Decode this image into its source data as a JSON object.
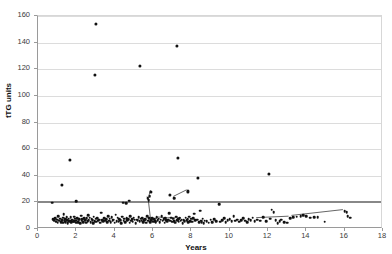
{
  "chart": {
    "title": "",
    "y_axis_title": "tTG units",
    "x_axis_title": "Years"
  },
  "chart_data": {
    "type": "scatter",
    "title": "",
    "xlabel": "Years",
    "ylabel": "tTG units",
    "xlim": [
      0,
      18
    ],
    "ylim": [
      0,
      160
    ],
    "xticks": [
      0,
      2,
      4,
      6,
      8,
      10,
      12,
      14,
      16,
      18
    ],
    "yticks": [
      0,
      20,
      40,
      60,
      80,
      100,
      120,
      140,
      160
    ],
    "grid": "horizontal",
    "legend": "none",
    "marker": "filled-circle",
    "marker_color": "#111111",
    "reference_line": {
      "orientation": "horizontal",
      "value": 20.5,
      "color": "#888888",
      "label": ""
    },
    "points": [
      [
        0.75,
        19.8
      ],
      [
        0.8,
        7.2
      ],
      [
        0.85,
        6.4
      ],
      [
        0.9,
        8.0
      ],
      [
        0.95,
        5.6
      ],
      [
        1.0,
        7.0
      ],
      [
        1.02,
        4.8
      ],
      [
        1.05,
        9.6
      ],
      [
        1.1,
        6.2
      ],
      [
        1.15,
        7.8
      ],
      [
        1.2,
        5.0
      ],
      [
        1.25,
        33.0
      ],
      [
        1.25,
        6.6
      ],
      [
        1.3,
        8.4
      ],
      [
        1.32,
        4.6
      ],
      [
        1.35,
        11.2
      ],
      [
        1.4,
        6.0
      ],
      [
        1.42,
        7.4
      ],
      [
        1.45,
        5.2
      ],
      [
        1.5,
        9.0
      ],
      [
        1.52,
        6.8
      ],
      [
        1.55,
        4.4
      ],
      [
        1.6,
        7.6
      ],
      [
        1.62,
        5.8
      ],
      [
        1.65,
        51.8
      ],
      [
        1.68,
        6.2
      ],
      [
        1.7,
        8.8
      ],
      [
        1.72,
        4.9
      ],
      [
        1.75,
        6.5
      ],
      [
        1.8,
        7.1
      ],
      [
        1.85,
        5.4
      ],
      [
        1.88,
        9.3
      ],
      [
        1.9,
        6.0
      ],
      [
        1.95,
        7.7
      ],
      [
        1.98,
        4.7
      ],
      [
        2.0,
        20.8
      ],
      [
        2.0,
        6.3
      ],
      [
        2.05,
        8.2
      ],
      [
        2.1,
        5.1
      ],
      [
        2.12,
        6.9
      ],
      [
        2.15,
        7.3
      ],
      [
        2.2,
        4.5
      ],
      [
        2.25,
        9.9
      ],
      [
        2.28,
        6.1
      ],
      [
        2.3,
        7.5
      ],
      [
        2.35,
        5.3
      ],
      [
        2.4,
        8.1
      ],
      [
        2.45,
        6.7
      ],
      [
        2.5,
        4.8
      ],
      [
        2.55,
        7.9
      ],
      [
        2.6,
        5.9
      ],
      [
        2.62,
        10.2
      ],
      [
        2.65,
        6.4
      ],
      [
        2.7,
        8.5
      ],
      [
        2.75,
        5.0
      ],
      [
        2.8,
        7.2
      ],
      [
        2.85,
        6.6
      ],
      [
        2.88,
        4.3
      ],
      [
        2.9,
        9.1
      ],
      [
        2.95,
        115.8
      ],
      [
        2.95,
        6.0
      ],
      [
        3.0,
        153.8
      ],
      [
        3.0,
        7.8
      ],
      [
        3.05,
        5.5
      ],
      [
        3.1,
        8.3
      ],
      [
        3.15,
        6.2
      ],
      [
        3.2,
        7.0
      ],
      [
        3.25,
        4.6
      ],
      [
        3.3,
        12.2
      ],
      [
        3.35,
        6.8
      ],
      [
        3.4,
        5.7
      ],
      [
        3.45,
        8.0
      ],
      [
        3.5,
        6.3
      ],
      [
        3.55,
        7.4
      ],
      [
        3.6,
        4.9
      ],
      [
        3.65,
        9.5
      ],
      [
        3.7,
        6.1
      ],
      [
        3.75,
        7.6
      ],
      [
        3.8,
        5.2
      ],
      [
        3.85,
        8.7
      ],
      [
        3.9,
        6.5
      ],
      [
        3.95,
        7.0
      ],
      [
        4.0,
        4.7
      ],
      [
        4.05,
        10.8
      ],
      [
        4.1,
        6.0
      ],
      [
        4.15,
        8.4
      ],
      [
        4.2,
        5.6
      ],
      [
        4.25,
        7.2
      ],
      [
        4.3,
        6.7
      ],
      [
        4.35,
        4.4
      ],
      [
        4.4,
        9.2
      ],
      [
        4.45,
        19.9
      ],
      [
        4.48,
        6.3
      ],
      [
        4.5,
        7.8
      ],
      [
        4.55,
        5.1
      ],
      [
        4.6,
        19.6
      ],
      [
        4.62,
        8.1
      ],
      [
        4.65,
        6.6
      ],
      [
        4.7,
        7.3
      ],
      [
        4.75,
        21.4
      ],
      [
        4.78,
        4.8
      ],
      [
        4.8,
        9.8
      ],
      [
        4.85,
        6.2
      ],
      [
        4.9,
        7.5
      ],
      [
        4.95,
        5.4
      ],
      [
        5.0,
        8.6
      ],
      [
        5.05,
        6.9
      ],
      [
        5.1,
        4.5
      ],
      [
        5.15,
        7.1
      ],
      [
        5.2,
        6.4
      ],
      [
        5.25,
        9.0
      ],
      [
        5.3,
        122.4
      ],
      [
        5.3,
        5.8
      ],
      [
        5.35,
        7.7
      ],
      [
        5.4,
        6.1
      ],
      [
        5.45,
        8.3
      ],
      [
        5.5,
        5.0
      ],
      [
        5.55,
        6.8
      ],
      [
        5.6,
        7.4
      ],
      [
        5.65,
        4.6
      ],
      [
        5.7,
        9.4
      ],
      [
        5.72,
        23.0
      ],
      [
        5.75,
        6.2
      ],
      [
        5.78,
        21.6
      ],
      [
        5.8,
        7.9
      ],
      [
        5.82,
        24.8
      ],
      [
        5.85,
        5.3
      ],
      [
        5.9,
        28.0
      ],
      [
        5.9,
        6.6
      ],
      [
        5.95,
        8.0
      ],
      [
        6.0,
        5.5
      ],
      [
        6.05,
        7.2
      ],
      [
        6.1,
        6.0
      ],
      [
        6.15,
        4.9
      ],
      [
        6.2,
        8.8
      ],
      [
        6.25,
        6.4
      ],
      [
        6.3,
        7.6
      ],
      [
        6.35,
        5.2
      ],
      [
        6.4,
        6.9
      ],
      [
        6.45,
        9.6
      ],
      [
        6.5,
        6.1
      ],
      [
        6.55,
        7.3
      ],
      [
        6.6,
        4.7
      ],
      [
        6.65,
        8.2
      ],
      [
        6.7,
        6.5
      ],
      [
        6.75,
        5.8
      ],
      [
        6.8,
        7.0
      ],
      [
        6.85,
        11.8
      ],
      [
        6.9,
        25.8
      ],
      [
        6.9,
        6.3
      ],
      [
        6.95,
        8.5
      ],
      [
        7.0,
        5.4
      ],
      [
        7.05,
        7.8
      ],
      [
        7.1,
        23.2
      ],
      [
        7.1,
        6.0
      ],
      [
        7.15,
        4.8
      ],
      [
        7.2,
        9.1
      ],
      [
        7.25,
        137.4
      ],
      [
        7.25,
        6.7
      ],
      [
        7.3,
        53.4
      ],
      [
        7.3,
        7.4
      ],
      [
        7.35,
        5.6
      ],
      [
        7.4,
        8.0
      ],
      [
        7.45,
        6.2
      ],
      [
        7.5,
        7.1
      ],
      [
        7.55,
        4.5
      ],
      [
        7.6,
        6.8
      ],
      [
        7.65,
        5.9
      ],
      [
        7.7,
        8.4
      ],
      [
        7.75,
        6.4
      ],
      [
        7.8,
        28.2
      ],
      [
        7.8,
        7.2
      ],
      [
        7.85,
        5.1
      ],
      [
        7.9,
        9.3
      ],
      [
        7.95,
        6.0
      ],
      [
        8.0,
        7.6
      ],
      [
        8.05,
        5.5
      ],
      [
        8.1,
        8.1
      ],
      [
        8.15,
        11.4
      ],
      [
        8.2,
        6.6
      ],
      [
        8.3,
        7.0
      ],
      [
        8.35,
        38.6
      ],
      [
        8.4,
        4.9
      ],
      [
        8.45,
        13.8
      ],
      [
        8.5,
        6.3
      ],
      [
        8.55,
        5.0
      ],
      [
        8.6,
        7.8
      ],
      [
        8.65,
        4.2
      ],
      [
        8.7,
        6.1
      ],
      [
        8.8,
        5.7
      ],
      [
        8.9,
        4.6
      ],
      [
        9.0,
        6.9
      ],
      [
        9.1,
        5.3
      ],
      [
        9.2,
        7.5
      ],
      [
        9.3,
        6.0
      ],
      [
        9.45,
        18.6
      ],
      [
        9.5,
        5.4
      ],
      [
        9.6,
        6.7
      ],
      [
        9.7,
        8.0
      ],
      [
        9.8,
        5.1
      ],
      [
        9.9,
        6.4
      ],
      [
        10.0,
        7.2
      ],
      [
        10.1,
        5.8
      ],
      [
        10.2,
        9.7
      ],
      [
        10.3,
        6.2
      ],
      [
        10.4,
        7.0
      ],
      [
        10.5,
        5.6
      ],
      [
        10.6,
        6.8
      ],
      [
        10.7,
        8.3
      ],
      [
        10.8,
        6.1
      ],
      [
        10.9,
        5.2
      ],
      [
        11.0,
        7.4
      ],
      [
        11.1,
        6.5
      ],
      [
        11.2,
        8.6
      ],
      [
        11.3,
        5.9
      ],
      [
        11.45,
        7.1
      ],
      [
        11.6,
        6.3
      ],
      [
        11.75,
        8.8
      ],
      [
        11.9,
        6.0
      ],
      [
        12.05,
        41.6
      ],
      [
        12.1,
        7.6
      ],
      [
        12.2,
        14.4
      ],
      [
        12.3,
        12.6
      ],
      [
        12.4,
        6.4
      ],
      [
        12.5,
        4.3
      ],
      [
        12.6,
        5.8
      ],
      [
        12.7,
        6.9
      ],
      [
        12.85,
        5.0
      ],
      [
        13.0,
        4.6
      ],
      [
        13.15,
        8.2
      ],
      [
        13.3,
        8.8
      ],
      [
        13.5,
        9.2
      ],
      [
        13.7,
        9.4
      ],
      [
        13.85,
        10.2
      ],
      [
        14.0,
        9.6
      ],
      [
        14.2,
        8.4
      ],
      [
        14.4,
        9.0
      ],
      [
        14.6,
        8.7
      ],
      [
        14.95,
        5.6
      ],
      [
        16.0,
        13.2
      ],
      [
        16.1,
        12.6
      ],
      [
        16.15,
        9.8
      ],
      [
        16.3,
        8.6
      ]
    ],
    "connected_segments": [
      {
        "points": [
          [
            5.72,
            23.0
          ],
          [
            5.78,
            21.6
          ],
          [
            5.9,
            28.0
          ]
        ]
      },
      {
        "points": [
          [
            5.78,
            21.6
          ],
          [
            5.9,
            6.6
          ],
          [
            6.0,
            5.5
          ],
          [
            6.3,
            7.6
          ],
          [
            6.8,
            7.0
          ],
          [
            7.5,
            7.1
          ]
        ]
      },
      {
        "points": [
          [
            7.1,
            23.2
          ],
          [
            7.8,
            28.2
          ]
        ]
      },
      {
        "points": [
          [
            13.3,
            8.8
          ],
          [
            16.0,
            13.2
          ]
        ]
      },
      {
        "points": [
          [
            11.45,
            7.1
          ],
          [
            13.15,
            8.2
          ]
        ]
      }
    ]
  }
}
